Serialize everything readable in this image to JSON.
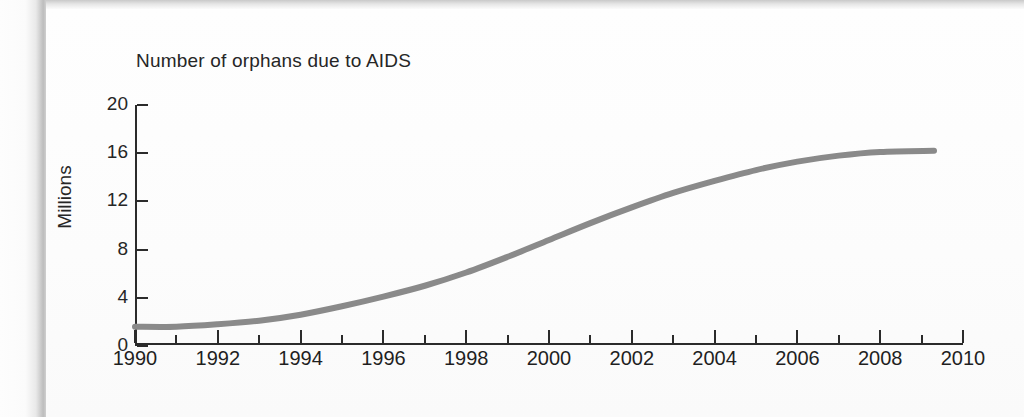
{
  "chart_data": {
    "type": "line",
    "title": "Number of orphans due to AIDS",
    "xlabel": "",
    "ylabel": "Millions",
    "xlim": [
      1990,
      2010
    ],
    "ylim": [
      0,
      20
    ],
    "grid": false,
    "legend": "none",
    "line_color": "#8a8a8a",
    "axis_color": "#2b2b2b",
    "x_ticks_major": [
      "1990",
      "1992",
      "1994",
      "1996",
      "1998",
      "2000",
      "2002",
      "2004",
      "2006",
      "2008",
      "2010"
    ],
    "x_ticks_minor": [
      "1991",
      "1993",
      "1995",
      "1997",
      "1999",
      "2001",
      "2003",
      "2005",
      "2007",
      "2009"
    ],
    "y_ticks": [
      "0",
      "4",
      "8",
      "12",
      "16",
      "20"
    ],
    "x": [
      1990,
      1991,
      1992,
      1993,
      1994,
      1995,
      1996,
      1997,
      1998,
      1999,
      2000,
      2001,
      2002,
      2003,
      2004,
      2005,
      2006,
      2007,
      2008,
      2009.3
    ],
    "values": [
      1.6,
      1.6,
      1.8,
      2.1,
      2.6,
      3.3,
      4.1,
      5.0,
      6.1,
      7.4,
      8.8,
      10.2,
      11.5,
      12.7,
      13.7,
      14.6,
      15.3,
      15.8,
      16.1,
      16.2
    ],
    "series": [
      {
        "name": "Number of orphans due to AIDS",
        "values": [
          1.6,
          1.6,
          1.8,
          2.1,
          2.6,
          3.3,
          4.1,
          5.0,
          6.1,
          7.4,
          8.8,
          10.2,
          11.5,
          12.7,
          13.7,
          14.6,
          15.3,
          15.8,
          16.1,
          16.2
        ]
      }
    ]
  }
}
